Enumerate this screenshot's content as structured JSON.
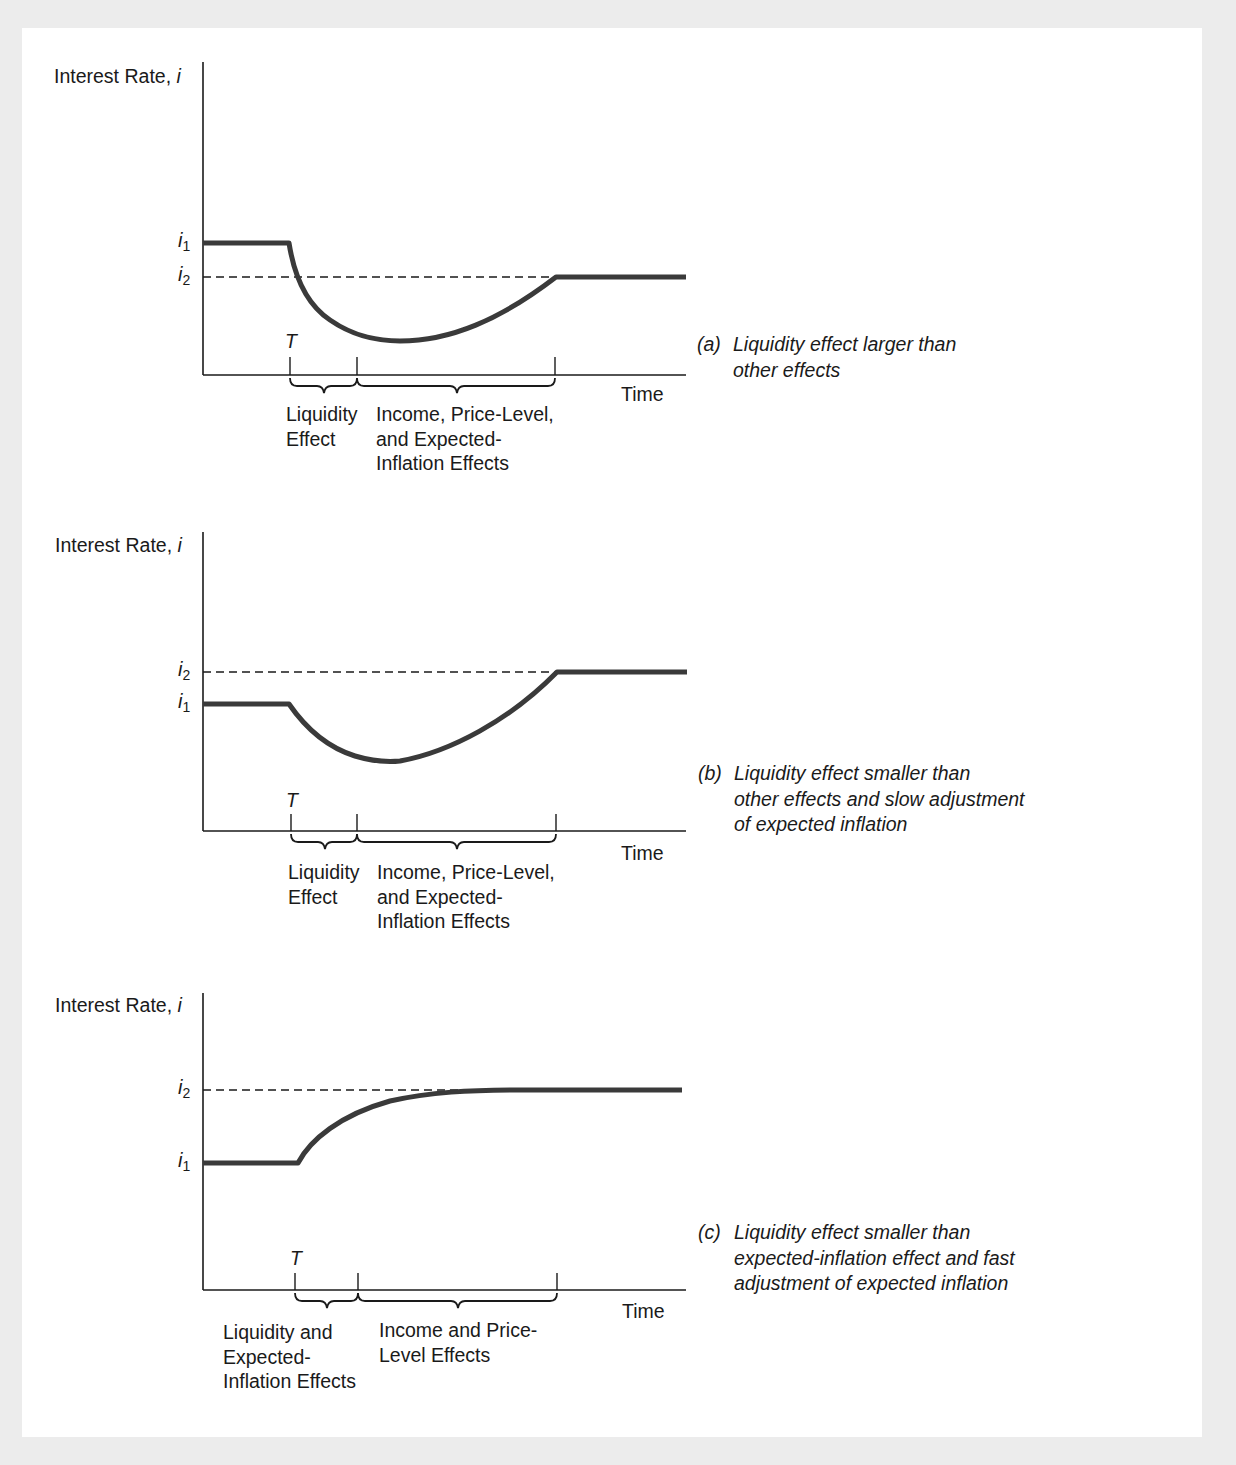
{
  "figure": {
    "panels": [
      {
        "id": "a",
        "y_axis_label": "Interest Rate,",
        "y_axis_symbol": "i",
        "x_axis_label": "Time",
        "levels": [
          {
            "name": "i",
            "sub": "1",
            "order": "upper"
          },
          {
            "name": "i",
            "sub": "2",
            "order": "lower",
            "dashed": true
          }
        ],
        "event_label": "T",
        "effects": [
          {
            "lines": [
              "Liquidity",
              "Effect"
            ]
          },
          {
            "lines": [
              "Income, Price-Level,",
              "and Expected-",
              "Inflation Effects"
            ]
          }
        ],
        "caption_tag": "(a)",
        "caption_lines": [
          "Liquidity effect larger than",
          "other effects"
        ]
      },
      {
        "id": "b",
        "y_axis_label": "Interest Rate,",
        "y_axis_symbol": "i",
        "x_axis_label": "Time",
        "levels": [
          {
            "name": "i",
            "sub": "2",
            "order": "upper",
            "dashed": true
          },
          {
            "name": "i",
            "sub": "1",
            "order": "lower"
          }
        ],
        "event_label": "T",
        "effects": [
          {
            "lines": [
              "Liquidity",
              "Effect"
            ]
          },
          {
            "lines": [
              "Income, Price-Level,",
              "and Expected-",
              "Inflation Effects"
            ]
          }
        ],
        "caption_tag": "(b)",
        "caption_lines": [
          "Liquidity effect smaller than",
          "other effects and slow adjustment",
          "of expected inflation"
        ]
      },
      {
        "id": "c",
        "y_axis_label": "Interest Rate,",
        "y_axis_symbol": "i",
        "x_axis_label": "Time",
        "levels": [
          {
            "name": "i",
            "sub": "2",
            "order": "upper",
            "dashed": true
          },
          {
            "name": "i",
            "sub": "1",
            "order": "lower"
          }
        ],
        "event_label": "T",
        "effects": [
          {
            "lines": [
              "Liquidity and",
              "Expected-",
              "Inflation Effects"
            ]
          },
          {
            "lines": [
              "Income and Price-",
              "Level Effects"
            ]
          }
        ],
        "caption_tag": "(c)",
        "caption_lines": [
          "Liquidity effect smaller than",
          "expected-inflation effect and fast",
          "adjustment of expected inflation"
        ]
      }
    ],
    "colors": {
      "background": "#ececec",
      "panel": "#ffffff",
      "curve": "#3a3a3a",
      "axis": "#1a1a1a",
      "text": "#1a1a1a"
    }
  }
}
